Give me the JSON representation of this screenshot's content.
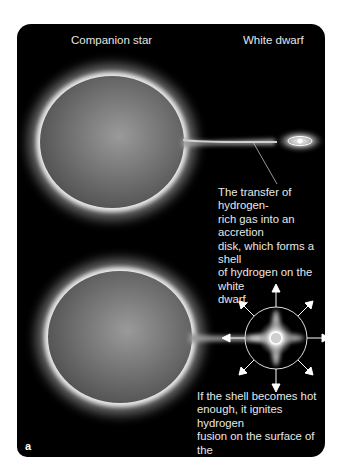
{
  "labels": {
    "companion_star": "Companion star",
    "white_dwarf": "White dwarf"
  },
  "captions": {
    "accretion": "The transfer of hydrogen-rich gas into an accretion disk, which forms a shell of hydrogen on the white dwarf.",
    "accretion_lines": [
      "The transfer of hydrogen-",
      "rich gas into an accretion",
      "disk, which forms a shell",
      "of hydrogen on the white",
      "dwarf."
    ],
    "fusion": "If the shell becomes hot enough, it ignites hydrogen fusion on the surface of the white dwarf.",
    "fusion_lines": [
      "If the shell becomes hot",
      "enough, it ignites hydrogen",
      "fusion on the surface of the",
      "white dwarf."
    ]
  },
  "panel_letter": "a",
  "colors": {
    "background": "#000000",
    "star_fill": "#7a7a7a",
    "glow": "#ffffff",
    "text": "#e8e8e8"
  }
}
